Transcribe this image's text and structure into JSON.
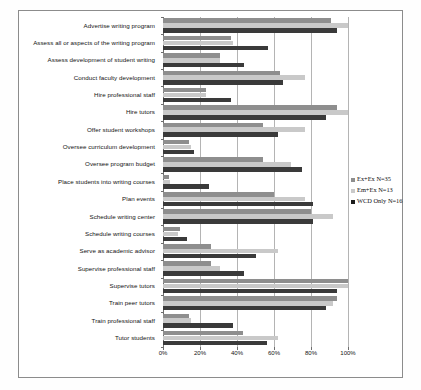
{
  "chart_data": {
    "type": "bar",
    "orientation": "horizontal",
    "title": "",
    "xlabel": "",
    "ylabel": "",
    "xlim": [
      0,
      100
    ],
    "xticks": [
      "0%",
      "20%",
      "40%",
      "60%",
      "80%",
      "100%"
    ],
    "xtick_values": [
      0,
      20,
      40,
      60,
      80,
      100
    ],
    "grid": true,
    "legend_position": "right",
    "categories": [
      "Advertise writing program",
      "Assess all or aspects of the writing program",
      "Assess development of student writing",
      "Conduct faculty development",
      "Hire professional staff",
      "Hire tutors",
      "Offer student workshops",
      "Oversee curriculum development",
      "Oversee program budget",
      "Place students into writing courses",
      "Plan events",
      "Schedule writing center",
      "Schedule writing courses",
      "Serve as academic advisor",
      "Supervise professional staff",
      "Supervise tutors",
      "Train peer tutors",
      "Train professional staff",
      "Tutor students"
    ],
    "series": [
      {
        "name": "Ex+Ex N=35",
        "color": "#8e8e8e",
        "values": [
          91,
          37,
          31,
          63,
          23,
          94,
          54,
          14,
          54,
          3,
          60,
          80,
          9,
          26,
          26,
          100,
          94,
          14,
          43
        ]
      },
      {
        "name": "Em+Ex N=13",
        "color": "#c9c9c9",
        "values": [
          100,
          38,
          31,
          77,
          23,
          100,
          77,
          15,
          69,
          4,
          77,
          92,
          8,
          62,
          31,
          100,
          92,
          15,
          62
        ]
      },
      {
        "name": "WCD Only N=16",
        "color": "#3a3a3a",
        "values": [
          94,
          57,
          44,
          65,
          37,
          88,
          62,
          17,
          75,
          25,
          81,
          81,
          13,
          50,
          44,
          94,
          88,
          38,
          56
        ]
      }
    ]
  },
  "legend": {
    "items": [
      {
        "label": "Ex+Ex N=35",
        "swatch": "legend-swatch-ex-ex"
      },
      {
        "label": "Em+Ex N=13",
        "swatch": "legend-swatch-em-ex"
      },
      {
        "label": "WCD Only N=16",
        "swatch": "legend-swatch-wcd-only"
      }
    ]
  }
}
